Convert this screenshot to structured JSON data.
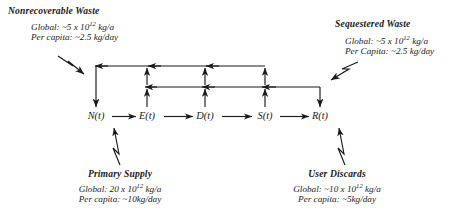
{
  "diagram": {
    "nodes": [
      {
        "id": "N",
        "label": "N(t)",
        "x": 96
      },
      {
        "id": "E",
        "label": "E(t)",
        "x": 147
      },
      {
        "id": "D",
        "label": "D(t)",
        "x": 205
      },
      {
        "id": "S",
        "label": "S(t)",
        "x": 265
      },
      {
        "id": "R",
        "label": "R(t)",
        "x": 320
      }
    ],
    "annotations": {
      "nonrecoverable_waste": {
        "title": "Nonrecoverable Waste",
        "global": "Global: ~5 x 10",
        "global_exp": "12",
        "global_unit": " kg/a",
        "per_capita": "Per capita: ~2.5 kg/day"
      },
      "sequestered_waste": {
        "title": "Sequestered Waste",
        "global": "Global: ~5 x 10",
        "global_exp": "12",
        "global_unit": " kg/a",
        "per_capita": "Per Capita: ~2.5 kg/day"
      },
      "primary_supply": {
        "title": "Primary Supply",
        "global": "Global: 20 x 10",
        "global_exp": "12",
        "global_unit": " kg/a",
        "per_capita": "Per capita: ~10kg/day"
      },
      "user_discards": {
        "title": "User Discards",
        "global": "Global: ~10 x 10",
        "global_exp": "12",
        "global_unit": " kg/a",
        "per_capita": "Per capita: ~5kg/day"
      }
    },
    "colors": {
      "stroke": "#1a1a1a",
      "text": "#1a1a1a",
      "background": "#ffffff"
    }
  }
}
